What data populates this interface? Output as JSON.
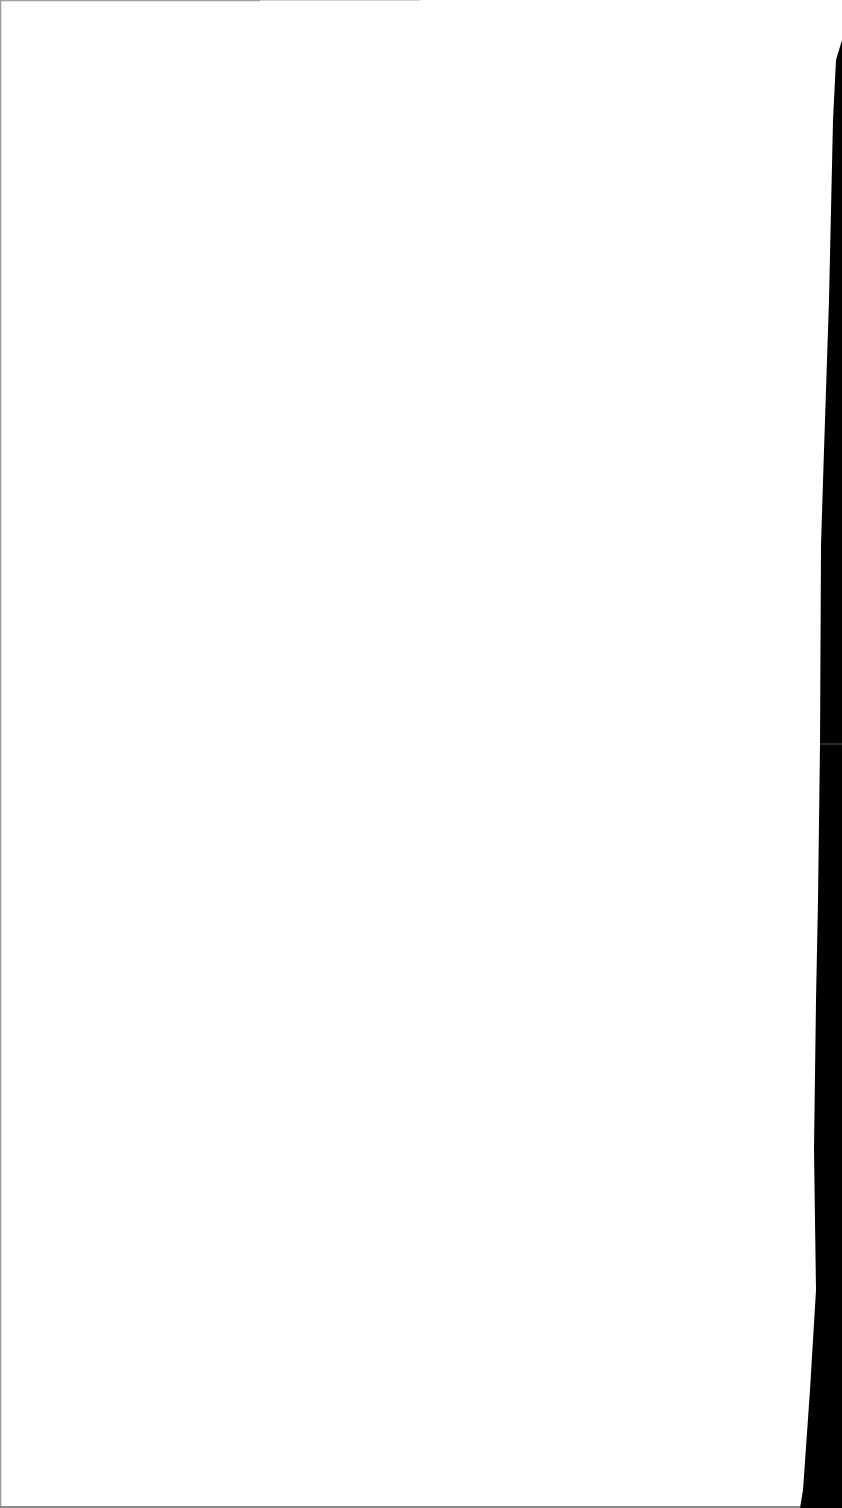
{
  "document": {
    "type": "scanned-page",
    "content": "",
    "page_color": "#ffffff",
    "background_color": "#000000",
    "edge_shadow_color": "#8a8a8a"
  }
}
